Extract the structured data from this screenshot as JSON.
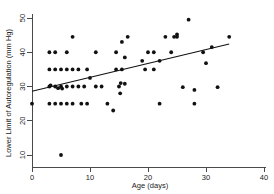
{
  "chart_data": {
    "type": "scatter",
    "title": "",
    "xlabel": "Age (days)",
    "ylabel": "Lower Limit of Autoregulation (mm Hg)",
    "xlim": [
      0,
      40
    ],
    "ylim": [
      10,
      50
    ],
    "xticks": [
      0,
      10,
      20,
      30,
      40
    ],
    "yticks": [
      10,
      20,
      30,
      40,
      50
    ],
    "xtick_labels": [
      "0",
      "10",
      "20",
      "30",
      "40"
    ],
    "ytick_labels": [
      "10",
      "20",
      "30",
      "40",
      "50"
    ],
    "grid": false,
    "legend": null,
    "marker": "filled-circle",
    "marker_color": "#111111",
    "points": [
      [
        0,
        25
      ],
      [
        3,
        25
      ],
      [
        4,
        25
      ],
      [
        5,
        25
      ],
      [
        6,
        25
      ],
      [
        7,
        25
      ],
      [
        8.5,
        25
      ],
      [
        9.5,
        25
      ],
      [
        13,
        25
      ],
      [
        14,
        23
      ],
      [
        22,
        25
      ],
      [
        28,
        25
      ],
      [
        3,
        30
      ],
      [
        3.2,
        30.3
      ],
      [
        4,
        30
      ],
      [
        4.5,
        29.5
      ],
      [
        5,
        30
      ],
      [
        5.2,
        29.4
      ],
      [
        6,
        30
      ],
      [
        7,
        30
      ],
      [
        8,
        30
      ],
      [
        9,
        30
      ],
      [
        11,
        30
      ],
      [
        12,
        30
      ],
      [
        15,
        30
      ],
      [
        15.3,
        31
      ],
      [
        16,
        30.8
      ],
      [
        15.2,
        28
      ],
      [
        26,
        29.8
      ],
      [
        28,
        29
      ],
      [
        32,
        29.8
      ],
      [
        3,
        35
      ],
      [
        4,
        35
      ],
      [
        5,
        35
      ],
      [
        6,
        35
      ],
      [
        7,
        35
      ],
      [
        8,
        35
      ],
      [
        9.5,
        35
      ],
      [
        10,
        32.5
      ],
      [
        14.5,
        35
      ],
      [
        15.5,
        35
      ],
      [
        19.5,
        35
      ],
      [
        21,
        35
      ],
      [
        19,
        37.5
      ],
      [
        22,
        37.5
      ],
      [
        30,
        36.8
      ],
      [
        3,
        40
      ],
      [
        4,
        40
      ],
      [
        6,
        40
      ],
      [
        11,
        40
      ],
      [
        14.5,
        40
      ],
      [
        16,
        38.5
      ],
      [
        20,
        40
      ],
      [
        21,
        40
      ],
      [
        24,
        40
      ],
      [
        29.5,
        40
      ],
      [
        7,
        44.5
      ],
      [
        15.5,
        43
      ],
      [
        16.5,
        44.5
      ],
      [
        23,
        44.5
      ],
      [
        24.5,
        44.5
      ],
      [
        25,
        44.5
      ],
      [
        25,
        45.2
      ],
      [
        31,
        41.5
      ],
      [
        34,
        44.5
      ],
      [
        27,
        49.5
      ],
      [
        5,
        10
      ]
    ],
    "fit_line": {
      "type": "linear-regression",
      "x_start": 0,
      "y_start": 28.6,
      "x_end": 34,
      "y_end": 42.4
    }
  }
}
